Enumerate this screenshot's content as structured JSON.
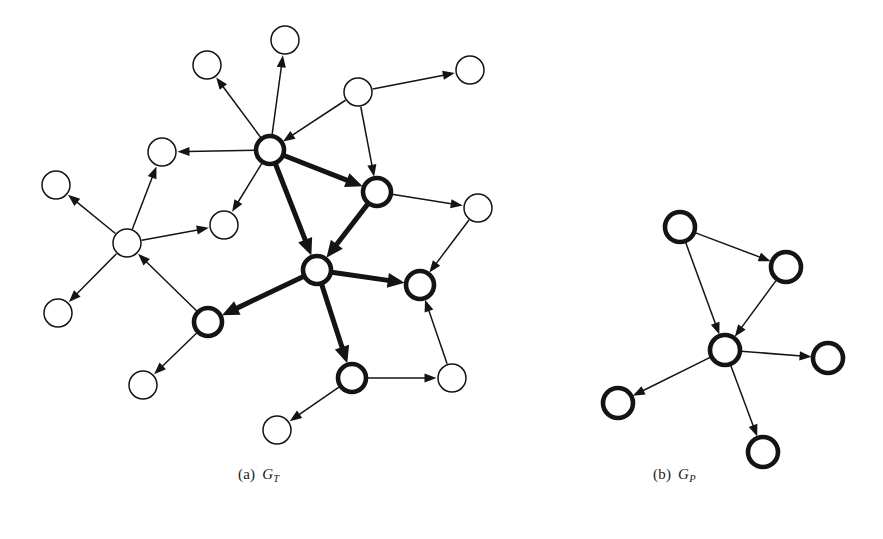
{
  "figure": {
    "type": "graph-diagram",
    "background": "#ffffff",
    "ink_color": "#141414",
    "panels": [
      {
        "id": "panel-a",
        "caption_index": "(a)",
        "caption_symbol": "G",
        "caption_subscript": "T",
        "caption_full": "(a) G_T",
        "description": "target graph with highlighted core subgraph",
        "node_count": 21,
        "bold_node_count": 7,
        "nodes": [
          {
            "id": "t1",
            "x": 207,
            "y": 65,
            "r": 14,
            "bold": false
          },
          {
            "id": "t2",
            "x": 285,
            "y": 40,
            "r": 14,
            "bold": false
          },
          {
            "id": "t3",
            "x": 358,
            "y": 92,
            "r": 14,
            "bold": false
          },
          {
            "id": "t4",
            "x": 470,
            "y": 70,
            "r": 14,
            "bold": false
          },
          {
            "id": "A",
            "x": 270,
            "y": 150,
            "r": 14,
            "bold": true
          },
          {
            "id": "t5",
            "x": 162,
            "y": 152,
            "r": 14,
            "bold": false
          },
          {
            "id": "C",
            "x": 377,
            "y": 192,
            "r": 14,
            "bold": true
          },
          {
            "id": "t6",
            "x": 478,
            "y": 208,
            "r": 14,
            "bold": false
          },
          {
            "id": "t7",
            "x": 56,
            "y": 185,
            "r": 14,
            "bold": false
          },
          {
            "id": "t8",
            "x": 127,
            "y": 243,
            "r": 14,
            "bold": false
          },
          {
            "id": "t9",
            "x": 224,
            "y": 225,
            "r": 14,
            "bold": false
          },
          {
            "id": "B",
            "x": 317,
            "y": 270,
            "r": 14,
            "bold": true
          },
          {
            "id": "D",
            "x": 420,
            "y": 285,
            "r": 14,
            "bold": true
          },
          {
            "id": "t10",
            "x": 58,
            "y": 313,
            "r": 14,
            "bold": false
          },
          {
            "id": "E",
            "x": 208,
            "y": 322,
            "r": 14,
            "bold": true
          },
          {
            "id": "F",
            "x": 352,
            "y": 378,
            "r": 14,
            "bold": true
          },
          {
            "id": "t11",
            "x": 452,
            "y": 378,
            "r": 14,
            "bold": false
          },
          {
            "id": "t12",
            "x": 143,
            "y": 385,
            "r": 14,
            "bold": false
          },
          {
            "id": "t13",
            "x": 277,
            "y": 430,
            "r": 14,
            "bold": false
          }
        ],
        "edges": [
          {
            "from": "A",
            "to": "t1",
            "bold": false
          },
          {
            "from": "A",
            "to": "t2",
            "bold": false
          },
          {
            "from": "t3",
            "to": "A",
            "bold": false
          },
          {
            "from": "t3",
            "to": "t4",
            "bold": false
          },
          {
            "from": "t3",
            "to": "C",
            "bold": false
          },
          {
            "from": "A",
            "to": "t5",
            "bold": false
          },
          {
            "from": "A",
            "to": "t9",
            "bold": false
          },
          {
            "from": "A",
            "to": "C",
            "bold": true
          },
          {
            "from": "A",
            "to": "B",
            "bold": true
          },
          {
            "from": "C",
            "to": "t6",
            "bold": false
          },
          {
            "from": "C",
            "to": "B",
            "bold": true
          },
          {
            "from": "t6",
            "to": "D",
            "bold": false
          },
          {
            "from": "t8",
            "to": "t7",
            "bold": false
          },
          {
            "from": "t8",
            "to": "t5",
            "bold": false
          },
          {
            "from": "t8",
            "to": "t9",
            "bold": false
          },
          {
            "from": "t8",
            "to": "t10",
            "bold": false
          },
          {
            "from": "E",
            "to": "t8",
            "bold": false
          },
          {
            "from": "B",
            "to": "D",
            "bold": true
          },
          {
            "from": "B",
            "to": "E",
            "bold": true
          },
          {
            "from": "B",
            "to": "F",
            "bold": true
          },
          {
            "from": "E",
            "to": "t12",
            "bold": false
          },
          {
            "from": "F",
            "to": "t11",
            "bold": false
          },
          {
            "from": "F",
            "to": "t13",
            "bold": false
          },
          {
            "from": "t11",
            "to": "D",
            "bold": false
          }
        ]
      },
      {
        "id": "panel-b",
        "caption_index": "(b)",
        "caption_symbol": "G",
        "caption_subscript": "P",
        "caption_full": "(b) G_P",
        "description": "pattern graph, all nodes highlighted",
        "node_count": 6,
        "bold_node_count": 6,
        "nodes": [
          {
            "id": "p1",
            "x": 680,
            "y": 227,
            "r": 15,
            "bold": true
          },
          {
            "id": "p2",
            "x": 786,
            "y": 267,
            "r": 15,
            "bold": true
          },
          {
            "id": "p3",
            "x": 725,
            "y": 350,
            "r": 15,
            "bold": true
          },
          {
            "id": "p4",
            "x": 828,
            "y": 358,
            "r": 15,
            "bold": true
          },
          {
            "id": "p5",
            "x": 618,
            "y": 403,
            "r": 15,
            "bold": true
          },
          {
            "id": "p6",
            "x": 763,
            "y": 452,
            "r": 15,
            "bold": true
          }
        ],
        "edges": [
          {
            "from": "p1",
            "to": "p2",
            "bold": false
          },
          {
            "from": "p1",
            "to": "p3",
            "bold": false
          },
          {
            "from": "p2",
            "to": "p3",
            "bold": false
          },
          {
            "from": "p3",
            "to": "p4",
            "bold": false
          },
          {
            "from": "p3",
            "to": "p5",
            "bold": false
          },
          {
            "from": "p3",
            "to": "p6",
            "bold": false
          }
        ]
      }
    ]
  }
}
